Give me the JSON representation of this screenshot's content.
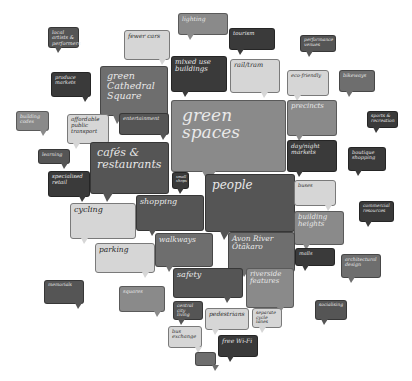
{
  "colors": {
    "black": "#3a3a3a",
    "dark": "#555555",
    "mid": "#6e6e6e",
    "midlight": "#8a8a8a",
    "light": "#d6d6d6",
    "background": "#ffffff"
  },
  "bubbles": [
    {
      "id": "local-artists",
      "label": "local artists & performers",
      "x": 48,
      "y": 27,
      "w": 31,
      "h": 21,
      "fs": 5,
      "tone": "dark",
      "tail": 6
    },
    {
      "id": "fewer-cars",
      "label": "fewer cars",
      "x": 124,
      "y": 30,
      "w": 46,
      "h": 30,
      "fs": 6,
      "tone": "light",
      "tail": 34
    },
    {
      "id": "lighting",
      "label": "lighting",
      "x": 178,
      "y": 13,
      "w": 50,
      "h": 22,
      "fs": 6,
      "tone": "midlight",
      "tail": 8
    },
    {
      "id": "tourism",
      "label": "tourism",
      "x": 229,
      "y": 28,
      "w": 46,
      "h": 22,
      "fs": 5.5,
      "tone": "black",
      "tail": 7
    },
    {
      "id": "performance-venues",
      "label": "performance venues",
      "x": 300,
      "y": 35,
      "w": 36,
      "h": 17,
      "fs": 4.5,
      "tone": "dark",
      "tail": 5
    },
    {
      "id": "produce-markets",
      "label": "produce markets",
      "x": 51,
      "y": 72,
      "w": 40,
      "h": 25,
      "fs": 5,
      "tone": "black",
      "tail": 30
    },
    {
      "id": "green-cathedral-square",
      "label": "green Cathedral Square",
      "x": 100,
      "y": 66,
      "w": 68,
      "h": 50,
      "fs": 9.5,
      "tone": "mid",
      "tail": 12,
      "size": "mid"
    },
    {
      "id": "mixed-use-buildings",
      "label": "mixed use buildings",
      "x": 171,
      "y": 56,
      "w": 56,
      "h": 36,
      "fs": 7,
      "tone": "black",
      "tail": 10
    },
    {
      "id": "rail-tram",
      "label": "rail/tram",
      "x": 230,
      "y": 59,
      "w": 50,
      "h": 34,
      "fs": 6.5,
      "tone": "light",
      "tail": 30
    },
    {
      "id": "eco-friendly",
      "label": "eco-friendly",
      "x": 287,
      "y": 70,
      "w": 42,
      "h": 26,
      "fs": 5,
      "tone": "light",
      "tail": 6
    },
    {
      "id": "bikeways",
      "label": "bikeways",
      "x": 339,
      "y": 70,
      "w": 36,
      "h": 22,
      "fs": 5,
      "tone": "mid",
      "tail": 6
    },
    {
      "id": "building-codes",
      "label": "building codes",
      "x": 16,
      "y": 111,
      "w": 33,
      "h": 20,
      "fs": 4.8,
      "tone": "midlight",
      "tail": 23
    },
    {
      "id": "affordable-public-transport",
      "label": "affordable public transport",
      "x": 67,
      "y": 114,
      "w": 42,
      "h": 30,
      "fs": 5.5,
      "tone": "light",
      "tail": 5
    },
    {
      "id": "entertainment",
      "label": "entertainment",
      "x": 119,
      "y": 113,
      "w": 50,
      "h": 22,
      "fs": 5,
      "tone": "dark",
      "tail": 40
    },
    {
      "id": "green-spaces",
      "label": "green spaces",
      "x": 171,
      "y": 100,
      "w": 115,
      "h": 72,
      "fs": 17,
      "tone": "midlight",
      "tail": 30,
      "size": "big"
    },
    {
      "id": "precincts",
      "label": "precincts",
      "x": 287,
      "y": 100,
      "w": 50,
      "h": 36,
      "fs": 7,
      "tone": "midlight",
      "tail": 8
    },
    {
      "id": "sports-recreation",
      "label": "sports & recreation",
      "x": 367,
      "y": 111,
      "w": 31,
      "h": 17,
      "fs": 4.5,
      "tone": "black",
      "tail": 5
    },
    {
      "id": "learning",
      "label": "learning",
      "x": 38,
      "y": 149,
      "w": 32,
      "h": 15,
      "fs": 4.8,
      "tone": "dark",
      "tail": 22
    },
    {
      "id": "cafes-restaurants",
      "label": "cafés & restaurants",
      "x": 119,
      "y": 142,
      "w": 50,
      "h": 0,
      "fs": 0,
      "tone": "dark",
      "tail": 0,
      "hidden": true
    },
    {
      "id": "cafes-and-restaurants",
      "label": "cafés & restaurants",
      "x": 90,
      "y": 142,
      "w": 79,
      "h": 52,
      "fs": 11,
      "tone": "dark",
      "tail": 12,
      "size": "mid"
    },
    {
      "id": "day-night-markets",
      "label": "day/night markets",
      "x": 287,
      "y": 140,
      "w": 50,
      "h": 32,
      "fs": 6,
      "tone": "black",
      "tail": 8
    },
    {
      "id": "boutique-shopping",
      "label": "boutique shopping",
      "x": 348,
      "y": 147,
      "w": 38,
      "h": 24,
      "fs": 5,
      "tone": "black",
      "tail": 6
    },
    {
      "id": "specialised-retail",
      "label": "specialised retail",
      "x": 48,
      "y": 171,
      "w": 42,
      "h": 26,
      "fs": 5.5,
      "tone": "black",
      "tail": 30
    },
    {
      "id": "small-shops",
      "label": "small shops",
      "x": 172,
      "y": 172,
      "w": 17,
      "h": 17,
      "fs": 3.8,
      "tone": "black",
      "tail": 4
    },
    {
      "id": "people",
      "label": "people",
      "x": 205,
      "y": 174,
      "w": 90,
      "h": 58,
      "fs": 12,
      "tone": "dark",
      "tail": 14,
      "size": "mid"
    },
    {
      "id": "buses",
      "label": "buses",
      "x": 294,
      "y": 180,
      "w": 42,
      "h": 26,
      "fs": 5,
      "tone": "light",
      "tail": 30
    },
    {
      "id": "commercial-resources",
      "label": "commercial resources",
      "x": 359,
      "y": 201,
      "w": 35,
      "h": 21,
      "fs": 4.5,
      "tone": "black",
      "tail": 5
    },
    {
      "id": "cycling",
      "label": "cycling",
      "x": 70,
      "y": 203,
      "w": 66,
      "h": 36,
      "fs": 8,
      "tone": "light",
      "tail": 10
    },
    {
      "id": "shopping",
      "label": "shopping",
      "x": 136,
      "y": 195,
      "w": 68,
      "h": 36,
      "fs": 8,
      "tone": "dark",
      "tail": 12
    },
    {
      "id": "building-heights",
      "label": "building heights",
      "x": 294,
      "y": 211,
      "w": 50,
      "h": 34,
      "fs": 7,
      "tone": "midlight",
      "tail": 8
    },
    {
      "id": "parking",
      "label": "parking",
      "x": 95,
      "y": 243,
      "w": 60,
      "h": 30,
      "fs": 7.5,
      "tone": "light",
      "tail": 46
    },
    {
      "id": "walkways",
      "label": "walkways",
      "x": 155,
      "y": 233,
      "w": 58,
      "h": 34,
      "fs": 7.5,
      "tone": "mid",
      "tail": 10
    },
    {
      "id": "avon-river-otakaro",
      "label": "Avon River Ōtākaro",
      "x": 228,
      "y": 232,
      "w": 67,
      "h": 40,
      "fs": 7.5,
      "tone": "mid",
      "tail": 12
    },
    {
      "id": "malls",
      "label": "malls",
      "x": 295,
      "y": 248,
      "w": 40,
      "h": 18,
      "fs": 5,
      "tone": "black",
      "tail": 6
    },
    {
      "id": "architectural-design",
      "label": "architectural design",
      "x": 341,
      "y": 254,
      "w": 40,
      "h": 24,
      "fs": 4.8,
      "tone": "mid",
      "tail": 6
    },
    {
      "id": "memorials",
      "label": "memorials",
      "x": 44,
      "y": 280,
      "w": 40,
      "h": 24,
      "fs": 4.5,
      "tone": "dark",
      "tail": 30
    },
    {
      "id": "safety",
      "label": "safety",
      "x": 173,
      "y": 268,
      "w": 70,
      "h": 30,
      "fs": 8,
      "tone": "dark",
      "tail": 50
    },
    {
      "id": "riverside-features",
      "label": "riverside features",
      "x": 246,
      "y": 268,
      "w": 48,
      "h": 40,
      "fs": 7,
      "tone": "midlight",
      "tail": 30
    },
    {
      "id": "squares",
      "label": "squares",
      "x": 119,
      "y": 286,
      "w": 46,
      "h": 26,
      "fs": 5,
      "tone": "midlight",
      "tail": 34
    },
    {
      "id": "central-city-living",
      "label": "central city living",
      "x": 173,
      "y": 301,
      "w": 30,
      "h": 19,
      "fs": 4.5,
      "tone": "dark",
      "tail": 4
    },
    {
      "id": "pedestrians",
      "label": "pedestrians",
      "x": 205,
      "y": 308,
      "w": 44,
      "h": 22,
      "fs": 6,
      "tone": "light",
      "tail": 6
    },
    {
      "id": "separate-cycle-lanes",
      "label": "separate cycle lanes",
      "x": 252,
      "y": 308,
      "w": 30,
      "h": 20,
      "fs": 4.5,
      "tone": "light",
      "tail": 6
    },
    {
      "id": "socialising",
      "label": "socialising",
      "x": 315,
      "y": 300,
      "w": 32,
      "h": 20,
      "fs": 4.5,
      "tone": "dark",
      "tail": 5
    },
    {
      "id": "bus-exchange",
      "label": "bus exchange",
      "x": 168,
      "y": 326,
      "w": 34,
      "h": 22,
      "fs": 5,
      "tone": "light",
      "tail": 26
    },
    {
      "id": "free-wi-fi",
      "label": "free Wi-Fi",
      "x": 218,
      "y": 335,
      "w": 40,
      "h": 22,
      "fs": 6,
      "tone": "black",
      "tail": 8
    },
    {
      "id": "blank",
      "label": "",
      "x": 195,
      "y": 352,
      "w": 21,
      "h": 14,
      "fs": 4,
      "tone": "mid",
      "tail": 16
    }
  ]
}
